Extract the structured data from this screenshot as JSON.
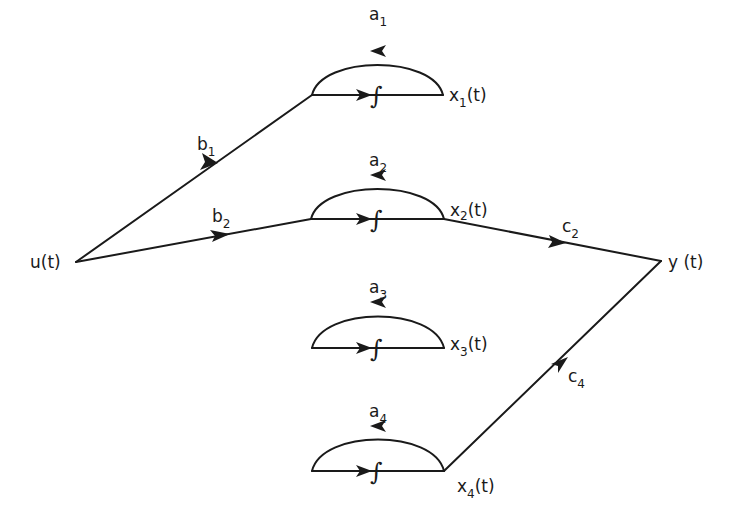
{
  "diagram": {
    "type": "signal-flow-graph",
    "input_node": {
      "id": "u",
      "label": "u(t)"
    },
    "output_node": {
      "id": "y",
      "label": "y (t)"
    },
    "integrator_symbol": "∫",
    "states": [
      {
        "id": "x1",
        "label": "x",
        "sub": "1",
        "suffix": "(t)",
        "feedback": {
          "label": "a",
          "sub": "1"
        },
        "input_gain": {
          "label": "b",
          "sub": "1"
        },
        "output_gain": null
      },
      {
        "id": "x2",
        "label": "x",
        "sub": "2",
        "suffix": "(t)",
        "feedback": {
          "label": "a",
          "sub": "2"
        },
        "input_gain": {
          "label": "b",
          "sub": "2"
        },
        "output_gain": {
          "label": "c",
          "sub": "2"
        }
      },
      {
        "id": "x3",
        "label": "x",
        "sub": "3",
        "suffix": "(t)",
        "feedback": {
          "label": "a",
          "sub": "3"
        },
        "input_gain": null,
        "output_gain": null
      },
      {
        "id": "x4",
        "label": "x",
        "sub": "4",
        "suffix": "(t)",
        "feedback": {
          "label": "a",
          "sub": "4"
        },
        "input_gain": null,
        "output_gain": {
          "label": "c",
          "sub": "4"
        }
      }
    ]
  }
}
